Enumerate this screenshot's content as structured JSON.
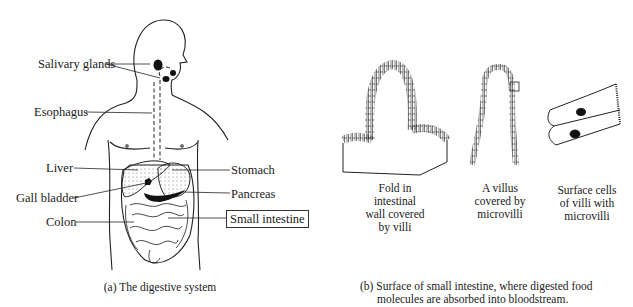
{
  "figure_a": {
    "labels": {
      "salivary_glands": "Salivary glands",
      "esophagus": "Esophagus",
      "liver": "Liver",
      "gall_bladder": "Gall bladder",
      "colon": "Colon",
      "stomach": "Stomach",
      "pancreas": "Pancreas",
      "small_intestine": "Small intestine"
    },
    "caption": "(a)  The digestive system"
  },
  "figure_b": {
    "panels": [
      {
        "lines": [
          "Fold in",
          "intestinal",
          "wall covered",
          "by villi"
        ]
      },
      {
        "lines": [
          "A villus",
          "covered by",
          "microvilli"
        ]
      },
      {
        "lines": [
          "Surface cells",
          "of villi with",
          "microvilli"
        ]
      }
    ],
    "caption_line1": "(b)  Surface of small intestine, where digested food",
    "caption_line2": "molecules are absorbed into bloodstream."
  }
}
